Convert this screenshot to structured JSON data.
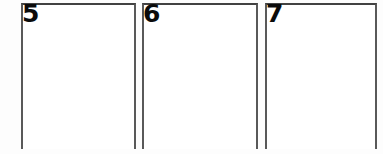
{
  "canvas": {
    "width": 383,
    "height": 154,
    "background_color": "#fdfdfd",
    "panel_fill_color": "#ffffff",
    "border_color": "#595959",
    "label_color": "#0b0b0b"
  },
  "panels": [
    {
      "label": "5",
      "left": 21,
      "top": 3,
      "width": 115,
      "height": 146
    },
    {
      "label": "6",
      "left": 142,
      "top": 3,
      "width": 116,
      "height": 146
    },
    {
      "label": "7",
      "left": 265,
      "top": 3,
      "width": 112,
      "height": 146
    }
  ]
}
